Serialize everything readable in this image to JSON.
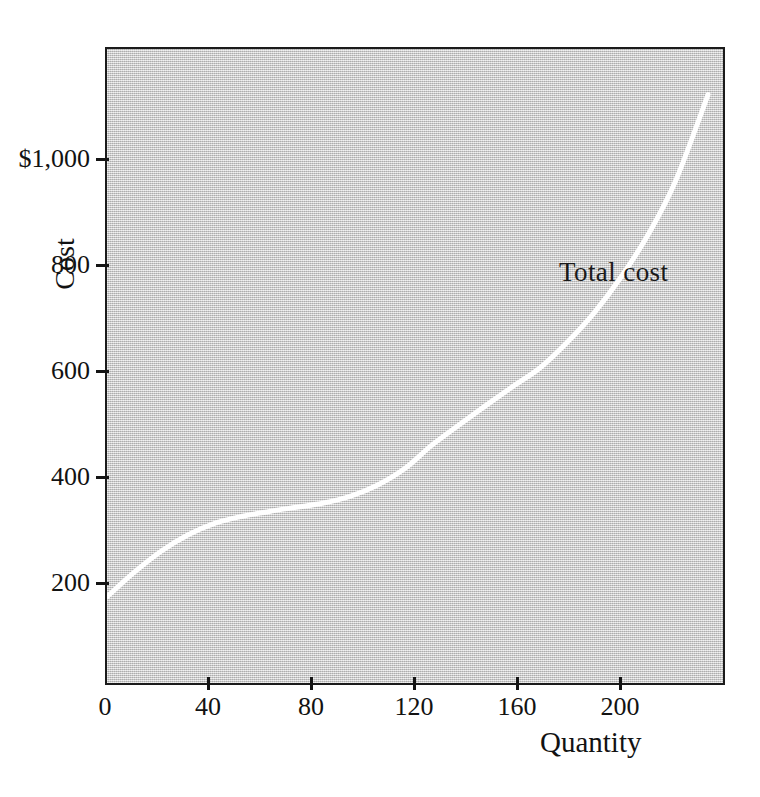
{
  "figure": {
    "background_color": "#ffffff",
    "plot_background_color": "#c9c9c9",
    "frame_color": "#1b1b1b",
    "curve_color": "#ffffff"
  },
  "chart_data": {
    "type": "line",
    "title": "",
    "subtitle": "",
    "xlabel": "Quantity",
    "ylabel": "Cost",
    "xlim": [
      0,
      229
    ],
    "ylim": [
      0,
      1203
    ],
    "grid": false,
    "legend_position": "inline-annotation",
    "x_ticks": [
      0,
      40,
      80,
      120,
      160,
      200
    ],
    "x_tick_labels": [
      "0",
      "40",
      "80",
      "120",
      "160",
      "200"
    ],
    "y_ticks": [
      200,
      400,
      600,
      800,
      1000
    ],
    "y_tick_labels": [
      "200",
      "400",
      "600",
      "800",
      "$1,000"
    ],
    "annotations": [
      {
        "text": "Total cost",
        "x": 136,
        "y": 905
      }
    ],
    "series": [
      {
        "name": "Total cost",
        "color": "#ffffff",
        "line_width": 5,
        "x": [
          0,
          10,
          20,
          30,
          40,
          50,
          60,
          70,
          80,
          90,
          100,
          110,
          120,
          130,
          140,
          150,
          160,
          170,
          180,
          190,
          200,
          210,
          222
        ],
        "values": [
          170,
          216,
          256,
          287,
          309,
          322,
          331,
          339,
          347,
          360,
          381,
          412,
          456,
          494,
          531,
          567,
          602,
          650,
          706,
          774,
          854,
          954,
          1117
        ]
      }
    ]
  },
  "axis_label_texts": {
    "y_axis_title": "Cost",
    "x_axis_title": "Quantity"
  }
}
